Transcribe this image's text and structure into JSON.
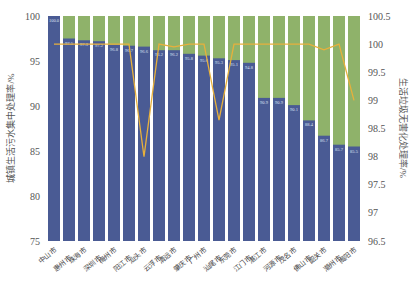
{
  "chart_data": {
    "type": "bar",
    "stacked_background": true,
    "categories": [
      "中山市",
      "惠州市",
      "珠海市",
      "深圳市",
      "梅州市",
      "阳江市",
      "汕头市",
      "云浮市",
      "清远市",
      "肇庆市",
      "广州市",
      "汕尾市",
      "东莞市",
      "江门市",
      "湛江市",
      "河源市",
      "茂名市",
      "佛山市",
      "韶关市",
      "潮州市",
      "揭阳市"
    ],
    "series": [
      {
        "name": "城镇生活污水集中处理率/%",
        "type": "bar",
        "axis": "left",
        "color": "#4a5b94",
        "values": [
          100.0,
          97.5,
          97.3,
          97.2,
          96.8,
          96.7,
          96.6,
          96.2,
          96.2,
          95.8,
          95.6,
          95.3,
          95.1,
          94.8,
          90.9,
          90.9,
          90.1,
          88.4,
          86.7,
          85.7,
          85.5
        ]
      },
      {
        "name": "生活垃圾无害化处理率/%",
        "type": "line",
        "axis": "right",
        "color": "#e7b03c",
        "values": [
          100,
          100,
          100,
          100,
          100,
          100,
          98.0,
          100,
          99.95,
          100,
          100,
          98.65,
          100,
          100,
          100,
          100,
          100,
          100,
          99.9,
          100,
          99.0
        ]
      }
    ],
    "bar_background_color": "#8fb26a",
    "title": "",
    "xlabel": "",
    "ylabel": "城镇生活污水集中处理率/%",
    "y2label": "生活垃圾无害化处理率/%",
    "ylim": [
      75,
      100
    ],
    "y2lim": [
      96.5,
      100.5
    ],
    "yticks": [
      75,
      80,
      85,
      90,
      95,
      100
    ],
    "y2ticks": [
      96.5,
      97,
      97.5,
      98,
      98.5,
      99,
      99.5,
      100,
      100.5
    ],
    "grid": false,
    "legend": "none"
  }
}
